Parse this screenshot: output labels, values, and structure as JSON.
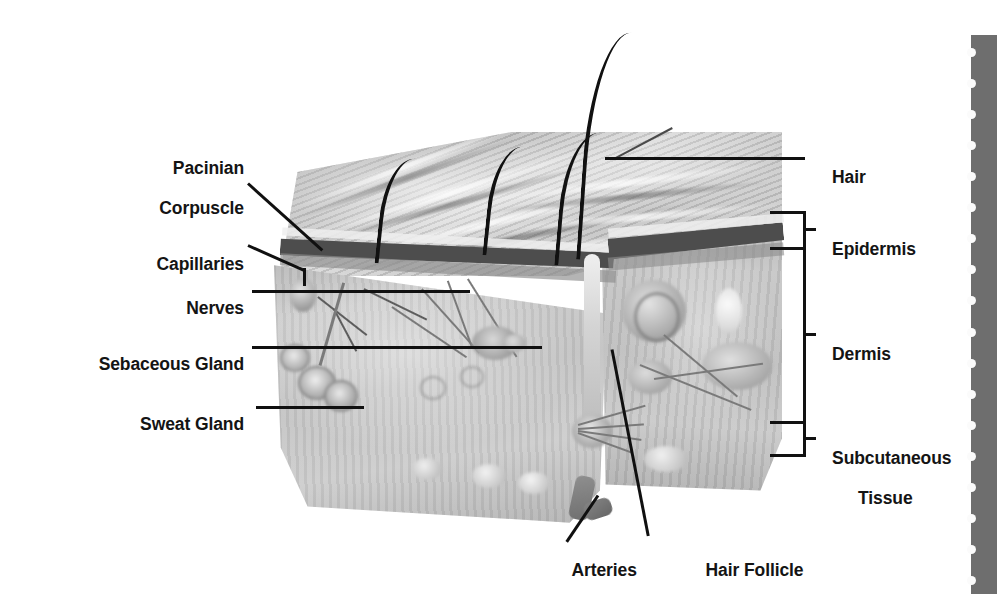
{
  "diagram": {
    "style": "grayscale medical illustration"
  },
  "labels_left": [
    {
      "id": "pacinian-corpuscle",
      "line1": "Pacinian",
      "line2": "Corpuscle"
    },
    {
      "id": "capillaries",
      "text": "Capillaries"
    },
    {
      "id": "nerves",
      "text": "Nerves"
    },
    {
      "id": "sebaceous-gland",
      "text": "Sebaceous Gland"
    },
    {
      "id": "sweat-gland",
      "text": "Sweat Gland"
    }
  ],
  "labels_right": [
    {
      "id": "hair",
      "text": "Hair"
    },
    {
      "id": "epidermis",
      "text": "Epidermis"
    },
    {
      "id": "dermis",
      "text": "Dermis"
    },
    {
      "id": "subcutaneous-tissue",
      "line1": "Subcutaneous",
      "line2": "Tissue"
    }
  ],
  "labels_bottom": [
    {
      "id": "arteries",
      "text": "Arteries"
    },
    {
      "id": "hair-follicle",
      "text": "Hair Follicle"
    }
  ],
  "brackets": [
    {
      "id": "epidermis-bracket",
      "layer": "Epidermis"
    },
    {
      "id": "dermis-bracket",
      "layer": "Dermis"
    },
    {
      "id": "subcutaneous-bracket",
      "layer": "Subcutaneous Tissue"
    }
  ],
  "colors": {
    "ink": "#141414",
    "leader": "#101010",
    "filmstrip": "#6e6e6e",
    "sprocket": "#fbfbfb",
    "epidermis_band": "#4d4d4d",
    "dermis_fill": "#c0c0c0",
    "background": "#ffffff"
  },
  "filmstrip": {
    "id": "filmstrip-edge",
    "sprocket_count": 18
  },
  "hair_count": 4
}
